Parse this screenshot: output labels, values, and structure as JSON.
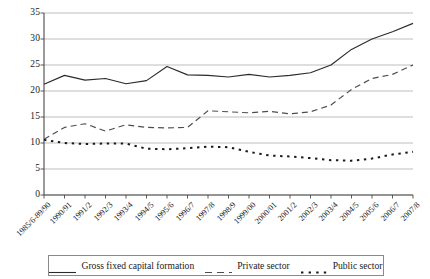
{
  "chart_data": {
    "type": "line",
    "title": "",
    "subtitle": "",
    "xlabel": "",
    "ylabel": "",
    "ylim": [
      0,
      35
    ],
    "ytick_step": 5,
    "yticks": [
      "0",
      "5",
      "10",
      "15",
      "20",
      "25",
      "30",
      "35"
    ],
    "grid": "horizontal",
    "legend_position": "bottom",
    "categories": [
      "1985/6-89/90",
      "1990/91",
      "1991/2",
      "1992/3",
      "1993/4",
      "1994/5",
      "1995/6",
      "1996/7",
      "1997/8",
      "1998/9",
      "1999/00",
      "2000/01",
      "2001/2",
      "2002/3",
      "2003/4",
      "2004/5",
      "2005/6",
      "2006/7",
      "2007/8"
    ],
    "series": [
      {
        "name": "Gross fixed capital formation",
        "style": "solid",
        "color": "#2b2b2b",
        "values": [
          21.3,
          23.0,
          22.1,
          22.4,
          21.4,
          22.0,
          24.7,
          23.1,
          23.0,
          22.7,
          23.2,
          22.7,
          23.0,
          23.5,
          25.0,
          28.0,
          30.0,
          31.4,
          33.0
        ]
      },
      {
        "name": "Private sector",
        "style": "dashed",
        "color": "#4d4d4d",
        "values": [
          10.7,
          13.0,
          13.7,
          12.3,
          13.5,
          13.0,
          12.9,
          13.0,
          16.2,
          16.0,
          15.8,
          16.1,
          15.6,
          16.0,
          17.3,
          20.3,
          22.4,
          23.2,
          25.0
        ]
      },
      {
        "name": "Public sector",
        "style": "dotted",
        "color": "#1a1a1a",
        "values": [
          10.6,
          10.0,
          9.8,
          9.9,
          9.9,
          8.9,
          8.8,
          9.0,
          9.3,
          9.2,
          8.3,
          7.6,
          7.4,
          7.1,
          6.7,
          6.6,
          7.0,
          7.8,
          8.3
        ]
      }
    ]
  },
  "legend": {
    "items": [
      {
        "label": "Gross fixed capital formation",
        "swatch": "solid-line-swatch"
      },
      {
        "label": "Private sector",
        "swatch": "dashed-line-swatch"
      },
      {
        "label": "Public sector",
        "swatch": "dotted-line-swatch"
      }
    ]
  },
  "colors": {
    "axis": "#4a4a4a",
    "grid": "#b6b6b6",
    "legend_border": "#8a8a8a",
    "background": "#ffffff",
    "text": "#1a1a1a"
  }
}
